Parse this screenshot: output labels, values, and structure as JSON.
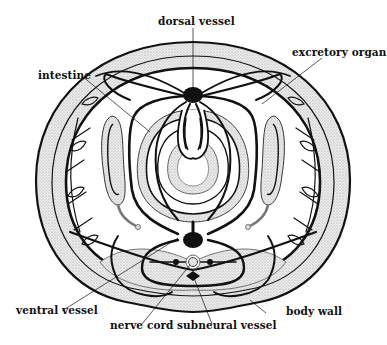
{
  "diagram": {
    "type": "cross-section",
    "labels": {
      "dorsal_vessel": "dorsal vessel",
      "intestine": "intestine",
      "excretory_organ": "excretory organ",
      "ventral_vessel": "ventral vessel",
      "nerve_cord": "nerve cord",
      "subneural_vessel": "subneural vessel",
      "body_wall": "body wall"
    },
    "colors": {
      "line": "#111111",
      "stipple": "#d9d9d9",
      "background": "#ffffff"
    }
  }
}
